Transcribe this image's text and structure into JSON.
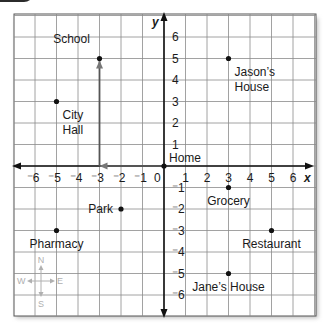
{
  "chart_data": {
    "type": "scatter",
    "title": "",
    "xlabel": "x",
    "ylabel": "y",
    "xlim": [
      -6,
      6
    ],
    "ylim": [
      -6,
      6
    ],
    "grid": true,
    "x_ticks": [
      "⁻6",
      "⁻5",
      "⁻4",
      "⁻3",
      "⁻2",
      "⁻1",
      "1",
      "2",
      "3",
      "4",
      "5",
      "6"
    ],
    "x_tick_values": [
      -6,
      -5,
      -4,
      -3,
      -2,
      -1,
      1,
      2,
      3,
      4,
      5,
      6
    ],
    "y_ticks": [
      "6",
      "5",
      "4",
      "3",
      "2",
      "1",
      "⁻1",
      "⁻2",
      "⁻3",
      "⁻4",
      "⁻5",
      "⁻6"
    ],
    "y_tick_values": [
      6,
      5,
      4,
      3,
      2,
      1,
      -1,
      -2,
      -3,
      -4,
      -5,
      -6
    ],
    "origin_label": "0",
    "points": [
      {
        "name": "School",
        "x": -3,
        "y": 5,
        "label_pos": "above-left"
      },
      {
        "name": "City Hall",
        "lines": [
          "City",
          "Hall"
        ],
        "x": -5,
        "y": 3,
        "label_pos": "below-right"
      },
      {
        "name": "Jason's House",
        "lines": [
          "Jason’s",
          "House"
        ],
        "x": 3,
        "y": 5,
        "label_pos": "below-right"
      },
      {
        "name": "Home",
        "x": 0,
        "y": 0,
        "label_pos": "above-right"
      },
      {
        "name": "Grocery",
        "x": 3,
        "y": -1,
        "label_pos": "below"
      },
      {
        "name": "Park",
        "x": -2,
        "y": -2,
        "label_pos": "left"
      },
      {
        "name": "Pharmacy",
        "x": -5,
        "y": -3,
        "label_pos": "below"
      },
      {
        "name": "Restaurant",
        "x": 5,
        "y": -3,
        "label_pos": "below"
      },
      {
        "name": "Jane's House",
        "lines": [
          "Jane’s House"
        ],
        "x": 3,
        "y": -5,
        "label_pos": "below"
      }
    ],
    "path": [
      {
        "from": [
          0,
          0
        ],
        "to": [
          -3,
          0
        ]
      },
      {
        "from": [
          -3,
          0
        ],
        "to": [
          -3,
          5
        ]
      }
    ],
    "compass": {
      "n": "N",
      "s": "S",
      "e": "E",
      "w": "W"
    }
  }
}
